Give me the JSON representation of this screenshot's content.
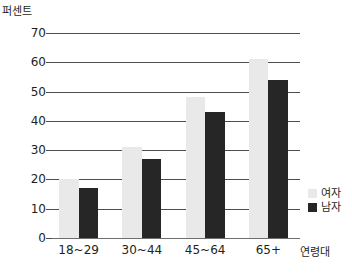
{
  "chart_data": {
    "type": "bar",
    "title": "",
    "ylabel": "퍼센트",
    "xlabel": "연령대",
    "categories": [
      "18~29",
      "30~44",
      "45~64",
      "65+"
    ],
    "series": [
      {
        "name": "여자",
        "color": "#e9e9e9",
        "values": [
          20,
          31,
          48,
          61
        ]
      },
      {
        "name": "남자",
        "color": "#262626",
        "values": [
          17,
          27,
          43,
          54
        ]
      }
    ],
    "ylim": [
      0,
      70
    ],
    "yticks": [
      0,
      10,
      20,
      30,
      40,
      50,
      60,
      70
    ],
    "ytick_labels": [
      "0",
      "10",
      "20",
      "30",
      "40",
      "50",
      "60",
      "70"
    ],
    "grid": true,
    "legend_position": "right"
  },
  "legend": {
    "items": [
      {
        "label": "여자",
        "swatch": "female-swatch"
      },
      {
        "label": "남자",
        "swatch": "male-swatch"
      }
    ]
  }
}
